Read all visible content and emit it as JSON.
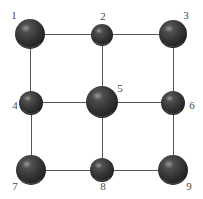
{
  "figure": {
    "kind": "graph-diagram",
    "background_color": "#ffffff",
    "width": 203,
    "height": 199
  },
  "style": {
    "edge_color": "#555555",
    "edge_width": 1,
    "node_fill_dark": "#2b2b2b",
    "node_fill_mid": "#3c3c3c",
    "node_highlight": "#6e6e6e",
    "label_color": "#4a4a4a",
    "label_font_size": 11
  },
  "nodes": [
    {
      "id": "1",
      "label": "1",
      "cx": 30,
      "cy": 34,
      "r": 15,
      "label_x": 7,
      "label_y": 10
    },
    {
      "id": "2",
      "label": "2",
      "cx": 102,
      "cy": 35,
      "r": 11,
      "label_x": 96,
      "label_y": 11
    },
    {
      "id": "3",
      "label": "3",
      "cx": 173,
      "cy": 34,
      "r": 14,
      "label_x": 179,
      "label_y": 10
    },
    {
      "id": "4",
      "label": "4",
      "cx": 31,
      "cy": 103,
      "r": 12,
      "label_x": 8,
      "label_y": 100
    },
    {
      "id": "5",
      "label": "5",
      "cx": 102,
      "cy": 102,
      "r": 16,
      "label_x": 113,
      "label_y": 83
    },
    {
      "id": "6",
      "label": "6",
      "cx": 173,
      "cy": 103,
      "r": 12,
      "label_x": 185,
      "label_y": 100
    },
    {
      "id": "7",
      "label": "7",
      "cx": 31,
      "cy": 170,
      "r": 15,
      "label_x": 8,
      "label_y": 181
    },
    {
      "id": "8",
      "label": "8",
      "cx": 102,
      "cy": 170,
      "r": 12,
      "label_x": 96,
      "label_y": 181
    },
    {
      "id": "9",
      "label": "9",
      "cx": 173,
      "cy": 170,
      "r": 15,
      "label_x": 182,
      "label_y": 181
    }
  ],
  "edges": [
    {
      "from": "1",
      "to": "2",
      "x1": 30,
      "y1": 34,
      "x2": 102,
      "y2": 35
    },
    {
      "from": "2",
      "to": "3",
      "x1": 102,
      "y1": 35,
      "x2": 173,
      "y2": 34
    },
    {
      "from": "4",
      "to": "5",
      "x1": 31,
      "y1": 103,
      "x2": 102,
      "y2": 102
    },
    {
      "from": "5",
      "to": "6",
      "x1": 102,
      "y1": 102,
      "x2": 173,
      "y2": 103
    },
    {
      "from": "7",
      "to": "8",
      "x1": 31,
      "y1": 170,
      "x2": 102,
      "y2": 170
    },
    {
      "from": "8",
      "to": "9",
      "x1": 102,
      "y1": 170,
      "x2": 173,
      "y2": 170
    },
    {
      "from": "1",
      "to": "4",
      "x1": 30,
      "y1": 34,
      "x2": 31,
      "y2": 103
    },
    {
      "from": "4",
      "to": "7",
      "x1": 31,
      "y1": 103,
      "x2": 31,
      "y2": 170
    },
    {
      "from": "2",
      "to": "5",
      "x1": 102,
      "y1": 35,
      "x2": 102,
      "y2": 102
    },
    {
      "from": "5",
      "to": "8",
      "x1": 102,
      "y1": 102,
      "x2": 102,
      "y2": 170
    },
    {
      "from": "3",
      "to": "6",
      "x1": 173,
      "y1": 34,
      "x2": 173,
      "y2": 103
    },
    {
      "from": "6",
      "to": "9",
      "x1": 173,
      "y1": 103,
      "x2": 173,
      "y2": 170
    }
  ]
}
